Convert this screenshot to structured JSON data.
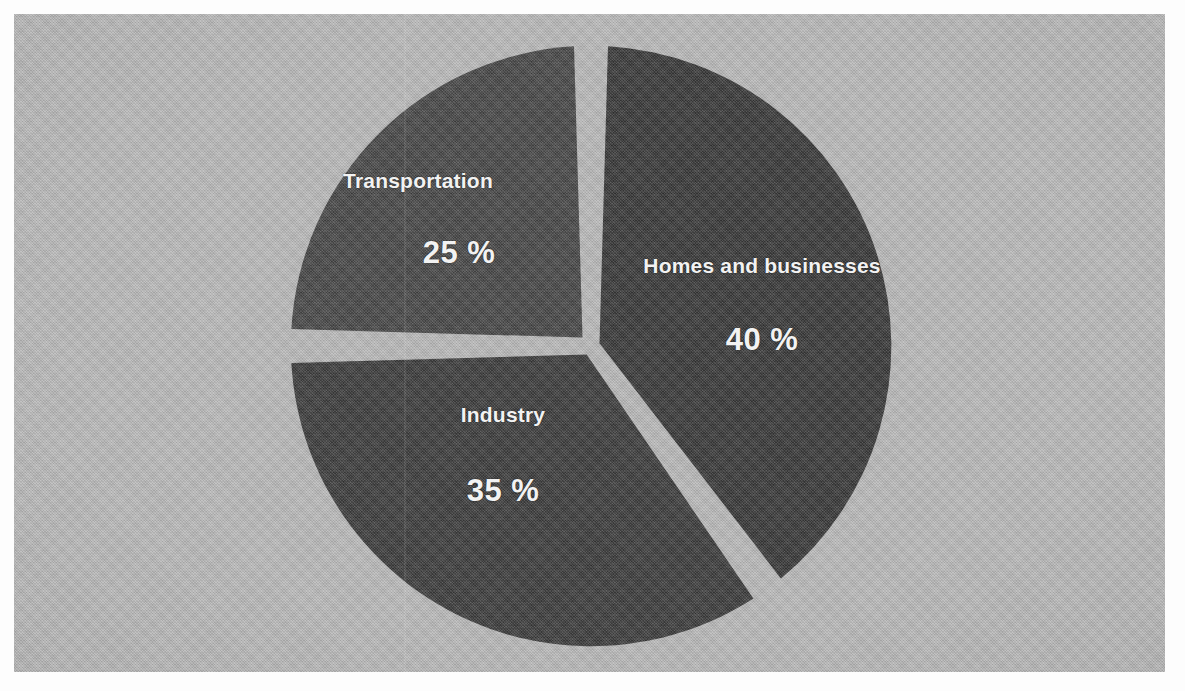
{
  "figure": {
    "background_color": "#b4b4b4",
    "border_color": "#ffffff",
    "label_text_color": "#f2f2f2"
  },
  "chart_data": {
    "type": "pie",
    "title": "",
    "subtitle": "",
    "xlabel": "",
    "ylabel": "",
    "legend_position": "none",
    "grid": false,
    "labels_inside_slices": true,
    "value_suffix": " %",
    "start_angle_deg": 0,
    "direction": "clockwise",
    "gap_px": 17,
    "categories": [
      "Homes and businesses",
      "Industry",
      "Transportation"
    ],
    "values": [
      40,
      35,
      25
    ],
    "slices": [
      {
        "label": "Homes and businesses",
        "value": 40,
        "value_text": "40 %",
        "color": "#2a2a2a",
        "start_angle_deg": 0,
        "end_angle_deg": 144
      },
      {
        "label": "Industry",
        "value": 35,
        "value_text": "35 %",
        "color": "#2e2e2e",
        "start_angle_deg": 144,
        "end_angle_deg": 270
      },
      {
        "label": "Transportation",
        "value": 25,
        "value_text": "25 %",
        "color": "#3a3a3a",
        "start_angle_deg": 270,
        "end_angle_deg": 360
      }
    ],
    "total": 100
  }
}
